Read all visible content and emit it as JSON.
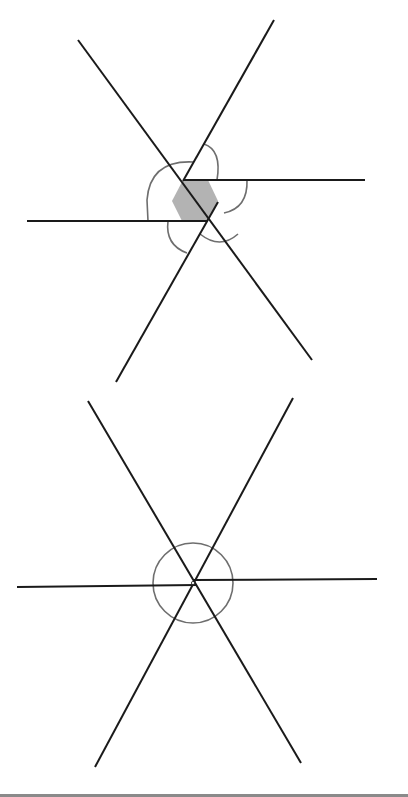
{
  "figure": {
    "colors": {
      "line": "#1a1a1a",
      "arc": "#6e6e6e",
      "hexagon_fill": "#b3b3b3",
      "background": "#ffffff",
      "bottom_rule": "#8a8a8a"
    },
    "top_diagram": {
      "description": "Six rays shifted apart forming a central shaded hexagon with angle arcs",
      "lines": [
        {
          "id": "descending",
          "x1": 78,
          "y1": 40,
          "x2": 312,
          "y2": 360
        },
        {
          "id": "rising",
          "x1": 274,
          "y1": 20,
          "x2": 183,
          "y2": 181
        },
        {
          "id": "right-horizontal",
          "x1": 183,
          "y1": 180,
          "x2": 365,
          "y2": 180
        },
        {
          "id": "left-horizontal",
          "x1": 27,
          "y1": 221,
          "x2": 208,
          "y2": 221
        },
        {
          "id": "lower-left",
          "x1": 218,
          "y1": 202,
          "x2": 116,
          "y2": 382
        }
      ],
      "hexagon": [
        [
          183,
          180
        ],
        [
          208,
          180
        ],
        [
          218,
          201
        ],
        [
          207,
          221
        ],
        [
          182,
          221
        ],
        [
          172,
          201
        ]
      ],
      "arcs": [
        {
          "id": "arc-top",
          "d": "M 204 144 Q 222 150 217 180"
        },
        {
          "id": "arc-upper-left",
          "d": "M 193 162 Q 150 160 147 200 L 148 221"
        },
        {
          "id": "arc-lower-left",
          "d": "M 168 221 Q 165 245 187 253"
        },
        {
          "id": "arc-bottom",
          "d": "M 200 234 Q 220 250 238 234"
        },
        {
          "id": "arc-right",
          "d": "M 247 180 Q 248 208 224 213"
        }
      ]
    },
    "bottom_diagram": {
      "description": "Six rays meeting at a single point with a full circle around the center",
      "center": {
        "x": 193,
        "y": 583
      },
      "circle_radius": 40,
      "lines": [
        {
          "id": "descending",
          "x1": 88,
          "y1": 401,
          "x2": 301,
          "y2": 763
        },
        {
          "id": "rising",
          "x1": 293,
          "y1": 398,
          "x2": 95,
          "y2": 767
        },
        {
          "id": "right-horizontal",
          "x1": 193,
          "y1": 580,
          "x2": 377,
          "y2": 579
        },
        {
          "id": "left-horizontal",
          "x1": 17,
          "y1": 587,
          "x2": 197,
          "y2": 585
        }
      ]
    }
  }
}
